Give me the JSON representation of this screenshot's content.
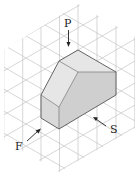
{
  "figure": {
    "labels": {
      "plan": "P",
      "front": "F",
      "side": "S"
    },
    "colors": {
      "grid": "#c4c4c4",
      "edge": "#555555",
      "face_top": "#e6e6e6",
      "face_front": "#d9d9d9",
      "face_side": "#cfcfcf",
      "text": "#222222"
    }
  }
}
